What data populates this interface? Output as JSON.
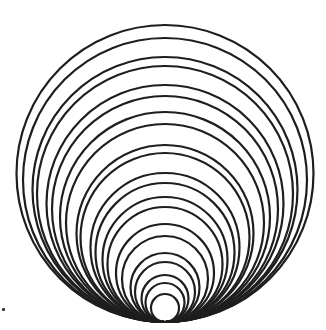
{
  "figure": {
    "stroke_color": "#1e1e1e",
    "background": "#ffffff",
    "tangent_point": {
      "x": 165,
      "y": 322
    },
    "stroke_width": 2.2,
    "circle_tops_y": [
      25,
      38,
      57,
      66,
      85,
      96,
      112,
      124,
      145,
      153,
      173,
      183,
      197,
      207,
      224,
      236,
      253,
      262,
      275,
      283,
      294
    ],
    "circle_count": 21
  },
  "speck": {
    "x": 2,
    "y": 308
  }
}
